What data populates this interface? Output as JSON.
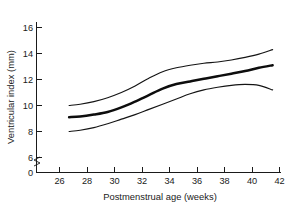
{
  "chart_data": {
    "type": "line",
    "title": "",
    "xlabel": "Postmenstrual age (weeks)",
    "ylabel": "Ventricular index (mm)",
    "xlim": [
      26,
      42
    ],
    "ylim": [
      6,
      16
    ],
    "y_axis_zero_label": "0",
    "y_axis_break": true,
    "grid": false,
    "legend": "none",
    "xticks": [
      26,
      28,
      30,
      32,
      34,
      36,
      38,
      40,
      42
    ],
    "xtick_labels": [
      "26",
      "28",
      "30",
      "32",
      "34",
      "36",
      "38",
      "40",
      "42"
    ],
    "yticks": [
      6,
      8,
      10,
      12,
      14,
      16
    ],
    "ytick_labels": [
      "6",
      "8",
      "10",
      "12",
      "14",
      "16"
    ],
    "x": [
      26.7,
      27.5,
      28.5,
      29.5,
      30.5,
      31.5,
      32.5,
      33.5,
      34.5,
      35.5,
      36.5,
      37.5,
      38.5,
      39.5,
      40.5,
      41.5
    ],
    "series": [
      {
        "name": "Upper limit (97th centile)",
        "style": "thin",
        "values": [
          10.0,
          10.1,
          10.3,
          10.6,
          11.0,
          11.5,
          12.1,
          12.6,
          12.9,
          13.1,
          13.25,
          13.35,
          13.5,
          13.7,
          13.95,
          14.3
        ]
      },
      {
        "name": "Mean",
        "style": "thick",
        "values": [
          9.1,
          9.15,
          9.3,
          9.5,
          9.85,
          10.3,
          10.8,
          11.3,
          11.65,
          11.85,
          12.05,
          12.25,
          12.45,
          12.65,
          12.9,
          13.1
        ]
      },
      {
        "name": "Lower limit (3rd centile)",
        "style": "thin",
        "values": [
          8.0,
          8.1,
          8.3,
          8.6,
          8.95,
          9.3,
          9.7,
          10.1,
          10.5,
          10.9,
          11.2,
          11.4,
          11.55,
          11.62,
          11.55,
          11.2
        ]
      }
    ]
  }
}
